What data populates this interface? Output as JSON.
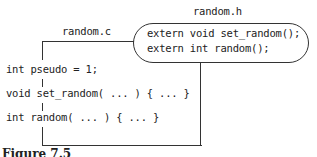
{
  "diagram": {
    "source_file": {
      "label": "random.c",
      "lines": [
        "int pseudo = 1;",
        "void set_random( ... ) { ... }",
        "int random( ... ) { ... }"
      ]
    },
    "header_file": {
      "label": "random.h",
      "lines": [
        "extern void set_random();",
        "extern int random();"
      ]
    },
    "caption": "Figure 7.5"
  }
}
